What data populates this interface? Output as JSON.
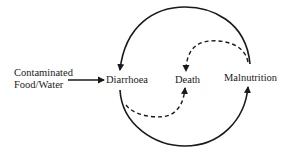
{
  "diagram": {
    "source": {
      "line1": "Contaminated",
      "line2": "Food/Water"
    },
    "nodes": {
      "diarrhoea": "Diarrhoea",
      "death": "Death",
      "malnutrition": "Malnutrition"
    },
    "edges": [
      {
        "from": "Contaminated Food/Water",
        "to": "Diarrhoea",
        "style": "solid"
      },
      {
        "from": "Malnutrition",
        "to": "Diarrhoea",
        "style": "solid",
        "path": "top arc"
      },
      {
        "from": "Diarrhoea",
        "to": "Malnutrition",
        "style": "solid",
        "path": "bottom arc"
      },
      {
        "from": "Malnutrition",
        "to": "Death",
        "style": "dashed",
        "path": "upper inner arc"
      },
      {
        "from": "Diarrhoea",
        "to": "Death",
        "style": "dashed",
        "path": "lower inner arc"
      }
    ],
    "colors": {
      "ink": "#1a1a1a",
      "background": "#ffffff"
    }
  }
}
